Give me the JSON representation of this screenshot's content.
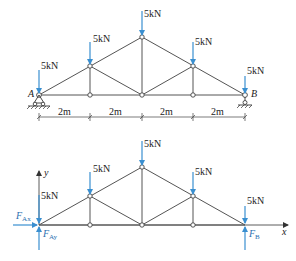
{
  "diagram": {
    "top": {
      "title": "Truss with supports",
      "load_labels": [
        "5kN",
        "5kN",
        "5kN",
        "5kN",
        "5kN"
      ],
      "support_labels": {
        "left": "A",
        "right": "B"
      },
      "dimensions": [
        "2m",
        "2m",
        "2m",
        "2m"
      ]
    },
    "bottom": {
      "title": "Free body diagram",
      "load_labels": [
        "5kN",
        "5kN",
        "5kN",
        "5kN",
        "5kN"
      ],
      "axis": {
        "x": "x",
        "y": "y"
      },
      "reactions": {
        "FAx": {
          "main": "F",
          "sub": "Ax"
        },
        "FAy": {
          "main": "F",
          "sub": "Ay"
        },
        "FB": {
          "main": "F",
          "sub": "B"
        }
      }
    },
    "colors": {
      "load": "#3a8fd0",
      "member": "#555555"
    }
  }
}
